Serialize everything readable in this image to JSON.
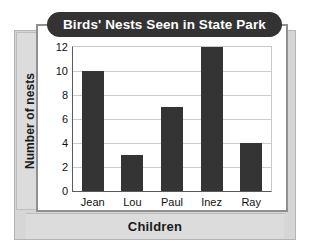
{
  "chart_data": {
    "type": "bar",
    "title": "Birds' Nests Seen in State Park",
    "xlabel": "Children",
    "ylabel": "Number of nests",
    "categories": [
      "Jean",
      "Lou",
      "Paul",
      "Inez",
      "Ray"
    ],
    "values": [
      10,
      3,
      7,
      12,
      4
    ],
    "ylim": [
      0,
      12
    ],
    "yticks": [
      0,
      2,
      4,
      6,
      8,
      10,
      12
    ],
    "ytick_labels": [
      "0",
      "2",
      "4",
      "6",
      "8",
      "10",
      "12"
    ],
    "grid": true,
    "legend": null,
    "legend_position": "none",
    "bar_color": "#343434",
    "title_background": "#333333",
    "title_text_color": "#ffffff",
    "panel_color": "#d6d6d6",
    "band_color": "#dcdcdc",
    "plot_background": "#ffffff",
    "gridline_color": "#cccccc",
    "axis_color": "#5a5a5a"
  }
}
